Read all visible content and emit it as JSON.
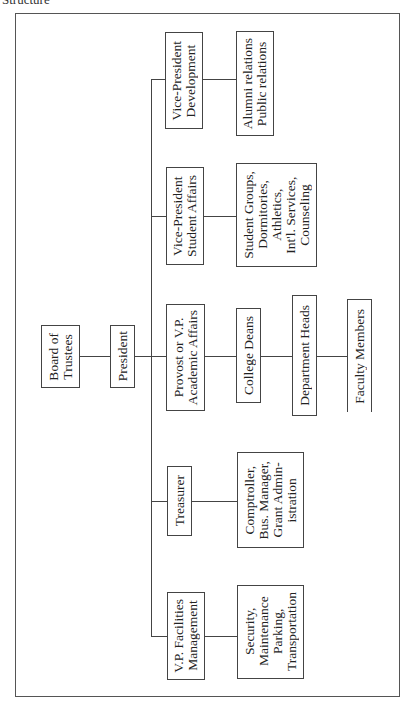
{
  "header": {
    "title": "Structure"
  },
  "chart": {
    "root": {
      "label": "Board of\nTrustees"
    },
    "president": {
      "label": "President"
    },
    "branches": [
      {
        "head": "Vice-President\nDevelopment",
        "children": [
          "Alumni relations\nPublic relations"
        ]
      },
      {
        "head": "Vice-President\nStudent Affairs",
        "children": [
          "Student Groups,\nDormitories,\nAthletics,\nInt'l. Services,\nCounseling"
        ]
      },
      {
        "head": "Provost or V.P.\nAcademic Affairs",
        "children": [
          "College Deans",
          "Department Heads",
          "Faculty Members"
        ]
      },
      {
        "head": "Treasurer",
        "children": [
          "Comptroller,\nBus. Manager,\nGrant Admin-\nistration"
        ]
      },
      {
        "head": "V.P. Facilities\nManagement",
        "children": [
          "Security,\nMaintenance\nParking,\nTransportation"
        ]
      }
    ]
  },
  "colors": {
    "line": "#444444",
    "text": "#222222",
    "background": "#ffffff"
  }
}
